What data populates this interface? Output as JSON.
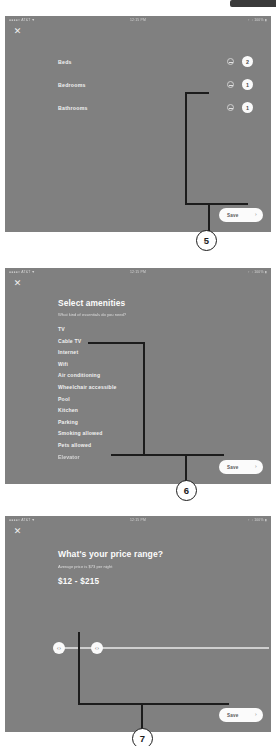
{
  "status_bar": {
    "left": "●●●●○  AT&T  ▼",
    "center": "12:15 PM",
    "right": "↑ ↓  100% ▮"
  },
  "icons": {
    "close": "✕",
    "chevron_right": "›",
    "slider_arrows": "‹›"
  },
  "screen_1": {
    "name": "rooms-and-beds",
    "save": {
      "label": "Save"
    },
    "rows": [
      {
        "label": "Beds",
        "count": "2",
        "decrement": "−"
      },
      {
        "label": "Bedrooms",
        "count": "1",
        "decrement": "−"
      },
      {
        "label": "Bathrooms",
        "count": "1",
        "decrement": "−"
      }
    ]
  },
  "screen_2": {
    "name": "select-amenities",
    "title": "Select amenities",
    "subtitle": "What kind of essentials do you need?",
    "save": {
      "label": "Save"
    },
    "amenities": [
      "TV",
      "Cable TV",
      "Internet",
      "Wifi",
      "Air conditioning",
      "Wheelchair accessible",
      "Pool",
      "Kitchen",
      "Parking",
      "Smoking allowed",
      "Pets allowed",
      "Elevator"
    ]
  },
  "screen_3": {
    "name": "price-range",
    "title": "What's your price range?",
    "subtitle": "Average price is $73 per night",
    "range_value": "$12 - $215",
    "min_handle": "‹›",
    "max_handle": "‹›",
    "save": {
      "label": "Save"
    }
  },
  "annotations": [
    {
      "number": "5"
    },
    {
      "number": "6"
    },
    {
      "number": "7"
    }
  ]
}
